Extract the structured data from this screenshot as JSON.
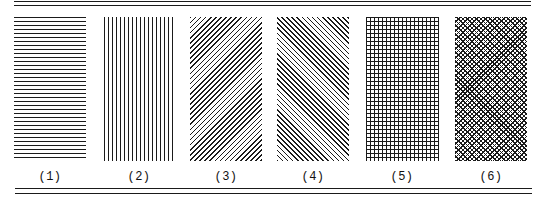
{
  "figure": {
    "patterns": [
      {
        "label": "(1)",
        "type": "horizontal-lines"
      },
      {
        "label": "(2)",
        "type": "vertical-lines"
      },
      {
        "label": "(3)",
        "type": "diagonal-lines-right"
      },
      {
        "label": "(4)",
        "type": "diagonal-lines-left"
      },
      {
        "label": "(5)",
        "type": "square-grid"
      },
      {
        "label": "(6)",
        "type": "diagonal-crosshatch"
      }
    ],
    "line_color": "#1a1a1a",
    "background": "#ffffff"
  }
}
